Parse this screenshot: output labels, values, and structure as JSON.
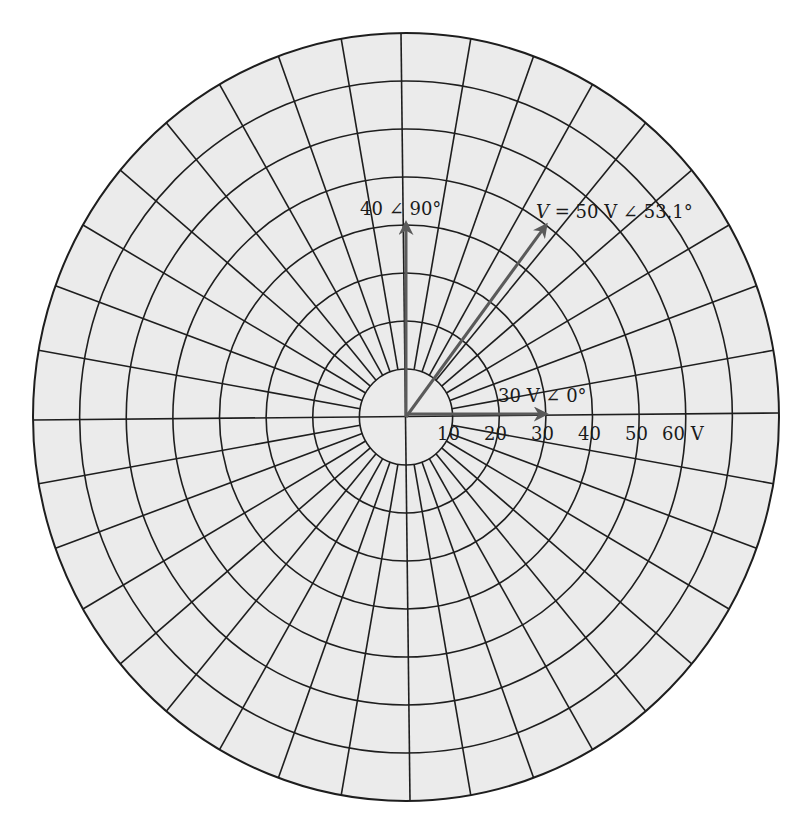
{
  "diagram": {
    "type": "polar-phasor-grid",
    "background_color": "#ebebeb",
    "line_color": "#1e1e1e",
    "phasor_color": "#5a5a5a",
    "center": [
      406,
      417
    ],
    "radius_x": 373,
    "radius_y": 384,
    "ring_step_volts": 10,
    "max_volts": 80,
    "inner_ring_volts": 10,
    "spoke_step_degrees": 10
  },
  "axis_labels": [
    {
      "text": "10",
      "x": 452
    },
    {
      "text": "20",
      "x": 499
    },
    {
      "text": "30",
      "x": 546
    },
    {
      "text": "40",
      "x": 593
    },
    {
      "text": "50",
      "x": 640
    },
    {
      "text": "60 V",
      "x": 690
    }
  ],
  "phasors": [
    {
      "name": "phasor-30v-0deg",
      "magnitude": 30,
      "angle_deg": 0,
      "label": "30 V ∠ 0°"
    },
    {
      "name": "phasor-40-90deg",
      "magnitude": 40,
      "angle_deg": 90,
      "label": "40 ∠ 90°"
    },
    {
      "name": "phasor-v-50v-53deg",
      "magnitude": 50,
      "angle_deg": 53.1,
      "label_var": "V",
      "label_rest": " = 50 V ∠ 53.1°"
    }
  ]
}
